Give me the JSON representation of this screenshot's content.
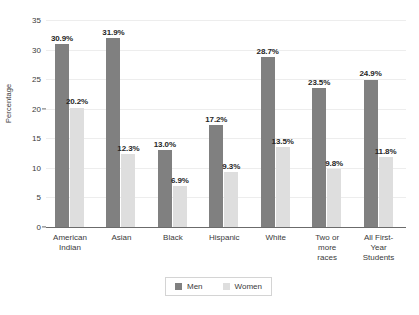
{
  "chart_data": {
    "type": "bar",
    "title": "",
    "subtitle": "",
    "xlabel": "",
    "ylabel": "Percentage",
    "ylim": [
      0,
      35
    ],
    "ytick_step": 5,
    "yticks": [
      0,
      5,
      10,
      15,
      20,
      25,
      30,
      35
    ],
    "grid": true,
    "grid_axis": "y",
    "legend_position": "bottom-center",
    "value_suffix": "%",
    "categories": [
      "American\nIndian",
      "Asian",
      "Black",
      "Hispanic",
      "White",
      "Two or\nmore\nraces",
      "All First-\nYear\nStudents"
    ],
    "series": [
      {
        "name": "Men",
        "color": "#808080",
        "values": [
          30.9,
          31.9,
          13.0,
          17.2,
          28.7,
          23.5,
          24.9
        ],
        "labels": [
          "30.9%",
          "31.9%",
          "13.0%",
          "17.2%",
          "28.7%",
          "23.5%",
          "24.9%"
        ]
      },
      {
        "name": "Women",
        "color": "#dedede",
        "values": [
          20.2,
          12.3,
          6.9,
          9.3,
          13.5,
          9.8,
          11.8
        ],
        "labels": [
          "20.2%",
          "12.3%",
          "6.9%",
          "9.3%",
          "13.5%",
          "9.8%",
          "11.8%"
        ]
      }
    ]
  },
  "axes": {
    "y_title": "Percentage",
    "ytick_labels": [
      "0",
      "5",
      "10",
      "15",
      "20",
      "25",
      "30",
      "35"
    ]
  },
  "legend": {
    "items": [
      {
        "label": "Men",
        "color": "#808080"
      },
      {
        "label": "Women",
        "color": "#dedede"
      }
    ]
  },
  "colors": {
    "men": "#808080",
    "women": "#dedede",
    "gridline": "#ededed",
    "axis": "#6b6b6b",
    "text": "#3a3a3a",
    "label_text": "#262626",
    "legend_border": "#d4d4d4",
    "background": "#ffffff"
  }
}
